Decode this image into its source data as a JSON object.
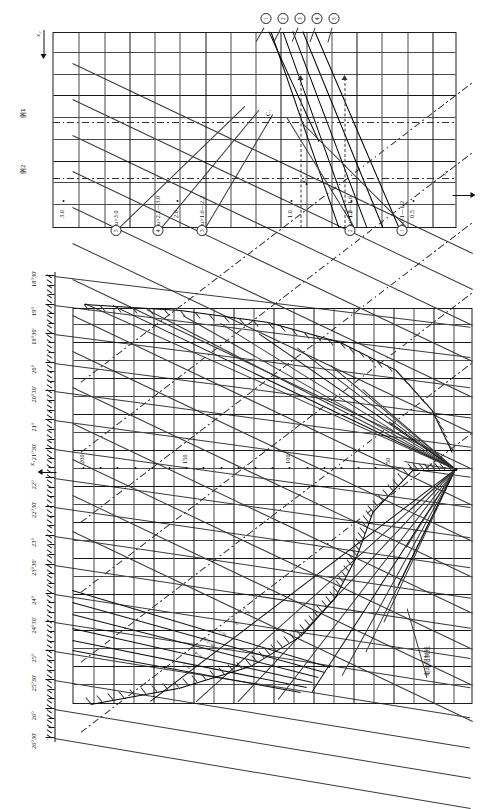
{
  "document": {
    "type": "engineering-nomogram",
    "note_label": "电动限制线"
  },
  "axes": {
    "z2_label": "z₂",
    "z1_label": "z₁",
    "x2_label": "x₂",
    "x1_label": "x₁"
  },
  "angle_scale": {
    "name": "alpha-angle-scale",
    "labels": [
      "26°30'",
      "26°",
      "25°30'",
      "25°",
      "24°30'",
      "24°",
      "23°30'",
      "23°",
      "22°30'",
      "22°",
      "21°30'",
      "21°",
      "20°30'",
      "20°",
      "19°30'",
      "19°",
      "18°30'"
    ]
  },
  "z2_scale": {
    "name": "z2-tooth-count-scale",
    "labels": [
      "200",
      "150",
      "100",
      "50"
    ]
  },
  "x_scale": {
    "name": "x-shift-scale",
    "labels": [
      "3.0",
      "2.0",
      "1.0"
    ]
  },
  "z1_scale": {
    "name": "z1-scale",
    "labels": [
      "1.0",
      "0.5"
    ]
  },
  "m_labels": {
    "name": "module-labels",
    "items": [
      "m=5",
      "m=4",
      "m=3.5",
      "m=3",
      "m=2.5",
      "m=2"
    ]
  },
  "examples": {
    "name": "example-callouts",
    "items": [
      "例1",
      "例2"
    ]
  },
  "curve_markers": {
    "name": "curve-index-markers",
    "items": [
      "1",
      "2",
      "3",
      "4",
      "5"
    ]
  },
  "point_labels": {
    "name": "construction-points",
    "items": [
      "C₁",
      "C₂"
    ]
  },
  "legend": {
    "name": "u-ratio-legend",
    "entries": [
      {
        "marker": "1",
        "text": "u=1—1.2"
      },
      {
        "marker": "2",
        "text": "u>1.2—1.6"
      },
      {
        "marker": "3",
        "text": "u>1.6—2.2"
      },
      {
        "marker": "4",
        "text": "u>2.2—3.0"
      },
      {
        "marker": "5",
        "text": "u>3.0"
      }
    ]
  },
  "colors": {
    "ink": "#121212",
    "grid": "#4a4a4a",
    "paper": "#ffffff"
  }
}
